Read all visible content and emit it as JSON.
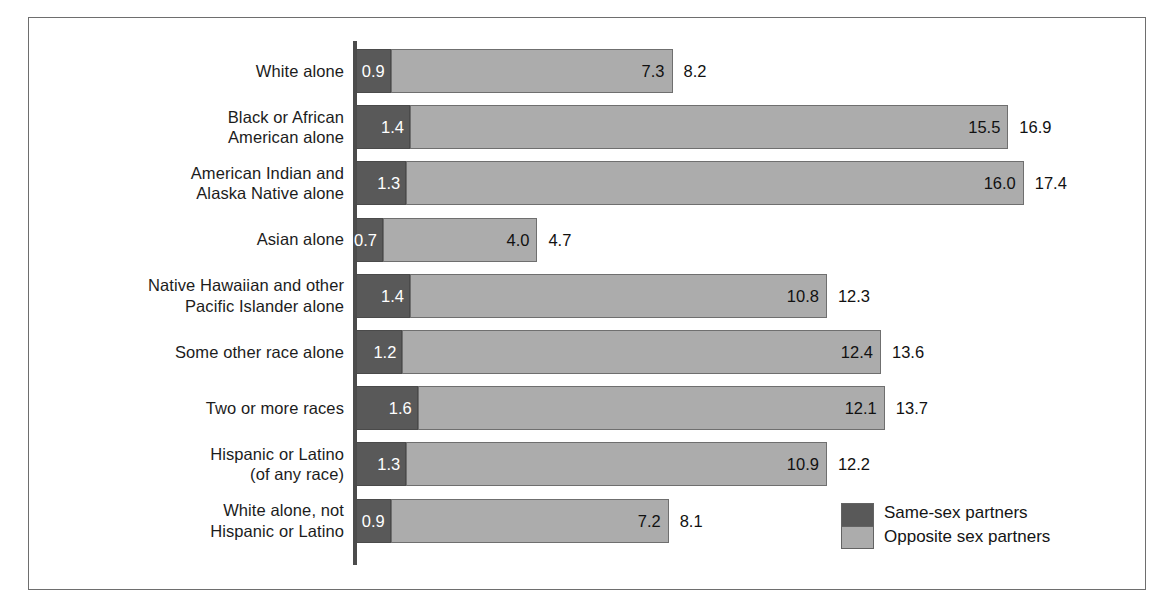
{
  "chart_data": {
    "type": "bar",
    "orientation": "horizontal",
    "stacked": true,
    "title": "",
    "subtitle": "",
    "xlabel": "",
    "ylabel": "",
    "xlim": [
      0,
      17.4
    ],
    "grid": false,
    "legend_position": "bottom-right",
    "categories": [
      "White alone",
      "Black or African American alone",
      "American Indian and Alaska Native alone",
      "Asian alone",
      "Native Hawaiian and other Pacific Islander alone",
      "Some other race alone",
      "Two or more races",
      "Hispanic or Latino (of any race)",
      "White alone, not Hispanic or Latino"
    ],
    "series": [
      {
        "name": "Same-sex partners",
        "color": "#595959",
        "values": [
          0.9,
          1.4,
          1.3,
          0.7,
          1.4,
          1.2,
          1.6,
          1.3,
          0.9
        ]
      },
      {
        "name": "Opposite sex partners",
        "color": "#acacac",
        "values": [
          7.3,
          15.5,
          16.0,
          4.0,
          10.8,
          12.4,
          12.1,
          10.9,
          7.2
        ]
      }
    ],
    "totals": [
      8.2,
      16.9,
      17.4,
      4.7,
      12.3,
      13.6,
      13.7,
      12.2,
      8.1
    ]
  },
  "rows": [
    {
      "label_lines": [
        "White alone"
      ],
      "same": "0.9",
      "opposite": "7.3",
      "total": "8.2",
      "same_value": 0.9,
      "opposite_value": 7.3,
      "total_value": 8.2
    },
    {
      "label_lines": [
        "Black or African",
        "American alone"
      ],
      "same": "1.4",
      "opposite": "15.5",
      "total": "16.9",
      "same_value": 1.4,
      "opposite_value": 15.5,
      "total_value": 16.9
    },
    {
      "label_lines": [
        "American Indian and",
        "Alaska Native alone"
      ],
      "same": "1.3",
      "opposite": "16.0",
      "total": "17.4",
      "same_value": 1.3,
      "opposite_value": 16.0,
      "total_value": 17.4
    },
    {
      "label_lines": [
        "Asian alone"
      ],
      "same": "0.7",
      "opposite": "4.0",
      "total": "4.7",
      "same_value": 0.7,
      "opposite_value": 4.0,
      "total_value": 4.7
    },
    {
      "label_lines": [
        "Native Hawaiian and other",
        "Pacific Islander alone"
      ],
      "same": "1.4",
      "opposite": "10.8",
      "total": "12.3",
      "same_value": 1.4,
      "opposite_value": 10.8,
      "total_value": 12.3
    },
    {
      "label_lines": [
        "Some other race alone"
      ],
      "same": "1.2",
      "opposite": "12.4",
      "total": "13.6",
      "same_value": 1.2,
      "opposite_value": 12.4,
      "total_value": 13.6
    },
    {
      "label_lines": [
        "Two or more races"
      ],
      "same": "1.6",
      "opposite": "12.1",
      "total": "13.7",
      "same_value": 1.6,
      "opposite_value": 12.1,
      "total_value": 13.7
    },
    {
      "label_lines": [
        "Hispanic or Latino",
        "(of any race)"
      ],
      "same": "1.3",
      "opposite": "10.9",
      "total": "12.2",
      "same_value": 1.3,
      "opposite_value": 10.9,
      "total_value": 12.2
    },
    {
      "label_lines": [
        "White alone, not",
        "Hispanic or Latino"
      ],
      "same": "0.9",
      "opposite": "7.2",
      "total": "8.1",
      "same_value": 0.9,
      "opposite_value": 7.2,
      "total_value": 8.1
    }
  ],
  "legend": {
    "items": [
      {
        "label": "Same-sex partners",
        "color": "#595959"
      },
      {
        "label": "Opposite sex partners",
        "color": "#acacac"
      }
    ]
  },
  "geometry": {
    "axis_x": 356,
    "px_per_unit": 38.6,
    "first_row_top": 49,
    "row_pitch": 56.2,
    "bar_height": 44
  }
}
